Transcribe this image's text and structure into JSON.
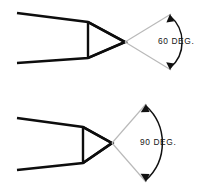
{
  "figure": {
    "background_color": "#ffffff",
    "line_color": "#0d0d0d",
    "extension_line_color": "#b9b9b9",
    "arc_color": "#111111",
    "text_color": "#161616"
  },
  "drawings": [
    {
      "id": "upper",
      "name": "sixty-degree-tool",
      "angle_value": "60",
      "angle_label": "60 DEG.",
      "tool_outline_points": "17,13 88,22 125,42 88,58 17,63",
      "point_triangle_points": "88,22 125,42 88,58",
      "point_face_line": "88,22 88,58",
      "apex": {
        "x": 125,
        "y": 42
      },
      "extension_upper": "125,42 171,14",
      "extension_lower": "125,42 171,70",
      "arc_path": "M 170,16 A 34 34 0 0 1 170,68",
      "arrow_upper": "170,14 166.4,22.6 174.2,21.2",
      "arrow_lower": "170,70 166.2,62.2 174.2,63.6",
      "label_x": 158,
      "label_y": 42
    },
    {
      "id": "lower",
      "name": "ninety-degree-tool",
      "angle_value": "90",
      "angle_label": "90 DEG.",
      "tool_outline_points": "17,118 83,127 112,143 83,163 17,170",
      "point_triangle_points": "83,127 112,143 83,163",
      "point_face_line": "83,127 83,163",
      "apex": {
        "x": 112,
        "y": 143
      },
      "extension_upper": "112,143 146,104",
      "extension_lower": "112,143 146,182",
      "arc_path": "M 146,106 A 50 50 0 0 1 146,180",
      "arrow_upper": "146,104 140.8,112.2 149.6,112.0",
      "arrow_lower": "146,182 140.6,173.8 149.6,174.0",
      "label_x": 140,
      "label_y": 143
    }
  ]
}
